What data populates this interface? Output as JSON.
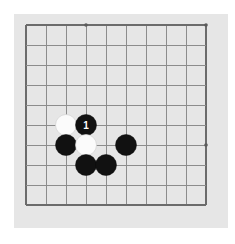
{
  "diagram": {
    "kind": "go-board-diagram",
    "board": {
      "background_color": "#e6e6e6",
      "page_background_color": "#ffffff",
      "line_color": "#8c8c8c",
      "edge_line_color": "#6b6b6b",
      "panel": {
        "x": 14,
        "y": 14,
        "width": 214,
        "height": 214
      },
      "origin": {
        "x": 26,
        "y": 25
      },
      "spacing": 20,
      "columns": 10,
      "rows": 10,
      "edges_drawn": {
        "left": true,
        "top": true,
        "right": true,
        "bottom": true
      },
      "star_point_color": "#5a5a5a",
      "star_point_radius": 1.8,
      "star_points": [
        {
          "col": 3,
          "row": 0
        },
        {
          "col": 9,
          "row": 0
        },
        {
          "col": 3,
          "row": 6
        },
        {
          "col": 9,
          "row": 6
        }
      ]
    },
    "stones": {
      "radius": 10.5,
      "black_color": "#111111",
      "white_color": "#fbfbfb",
      "list": [
        {
          "col": 2,
          "row": 5,
          "color": "white",
          "label": ""
        },
        {
          "col": 3,
          "row": 5,
          "color": "black",
          "label": "1"
        },
        {
          "col": 2,
          "row": 6,
          "color": "black",
          "label": ""
        },
        {
          "col": 3,
          "row": 6,
          "color": "white",
          "label": ""
        },
        {
          "col": 5,
          "row": 6,
          "color": "black",
          "label": ""
        },
        {
          "col": 3,
          "row": 7,
          "color": "black",
          "label": ""
        },
        {
          "col": 4,
          "row": 7,
          "color": "black",
          "label": ""
        }
      ]
    },
    "move_numbers": [
      "1"
    ]
  }
}
